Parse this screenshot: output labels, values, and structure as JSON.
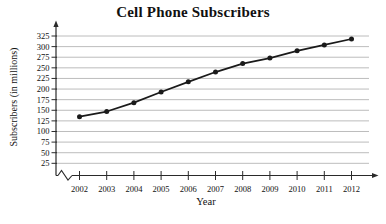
{
  "chart_data": {
    "type": "line",
    "title": "Cell Phone Subscribers",
    "xlabel": "Year",
    "ylabel": "Subscribers (in millions)",
    "categories": [
      "2002",
      "2003",
      "2004",
      "2005",
      "2006",
      "2007",
      "2008",
      "2009",
      "2010",
      "2011",
      "2012"
    ],
    "values": [
      135,
      147,
      168,
      193,
      217,
      240,
      260,
      273,
      290,
      304,
      318
    ],
    "y_ticks": [
      25,
      50,
      75,
      100,
      125,
      150,
      175,
      200,
      225,
      250,
      275,
      300,
      325
    ],
    "ylim": [
      25,
      325
    ],
    "y_tick_step": 25,
    "grid": "horizontal",
    "legend": "none",
    "x_axis_break": true,
    "marker": "circle",
    "colors": {
      "line": "#1a1a1a",
      "marker": "#1a1a1a",
      "grid": "#b4b4b4",
      "axis": "#2a2a2a",
      "text": "#111111"
    }
  }
}
